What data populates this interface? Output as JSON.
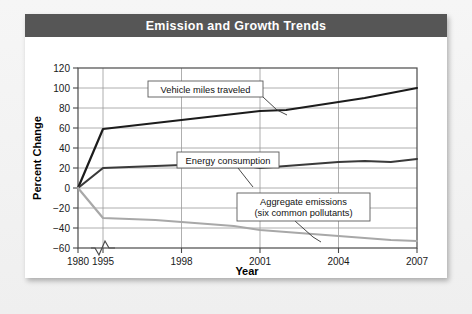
{
  "card": {
    "title": "Emission and Growth Trends"
  },
  "chart_data": {
    "type": "line",
    "title": "Emission and Growth Trends",
    "xlabel": "Year",
    "ylabel": "Percent Change",
    "xlim": [
      1980,
      2007
    ],
    "ylim": [
      -60,
      120
    ],
    "x_ticks": [
      "1980",
      "1995",
      "1998",
      "2001",
      "2004",
      "2007"
    ],
    "x_tick_values": [
      1980,
      1995,
      1998,
      2001,
      2004,
      2007
    ],
    "y_ticks": [
      "120",
      "100",
      "80",
      "60",
      "40",
      "20",
      "0",
      "−20",
      "−40",
      "−60"
    ],
    "y_tick_values": [
      120,
      100,
      80,
      60,
      40,
      20,
      0,
      -20,
      -40,
      -60
    ],
    "grid": true,
    "legend": "callout-labels",
    "axis_break": {
      "axis": "x",
      "between": [
        1980,
        1995
      ],
      "symbol": "zigzag"
    },
    "x": [
      1980,
      1995,
      1996,
      1997,
      1998,
      1999,
      2000,
      2001,
      2002,
      2003,
      2004,
      2005,
      2006,
      2007
    ],
    "series": [
      {
        "name": "Vehicle miles traveled",
        "color": "#1c1c1c",
        "values": [
          0,
          59,
          62,
          65,
          68,
          71,
          74,
          77,
          78,
          82,
          86,
          90,
          95,
          100
        ]
      },
      {
        "name": "Energy consumption",
        "color": "#3a3a3a",
        "values": [
          0,
          20,
          21,
          22,
          23,
          24,
          24,
          20,
          22,
          24,
          26,
          27,
          26,
          29
        ]
      },
      {
        "name": "Aggregate emissions (six common pollutants)",
        "color": "#a8a8a8",
        "values": [
          0,
          -30,
          -31,
          -32,
          -34,
          -36,
          -38,
          -42,
          -44,
          -46,
          -48,
          -50,
          -52,
          -53
        ]
      }
    ],
    "annotations": [
      {
        "name": "vehicle-miles-callout",
        "lines": [
          "Vehicle miles traveled"
        ],
        "points_to_series": "Vehicle miles traveled"
      },
      {
        "name": "energy-consumption-callout",
        "lines": [
          "Energy consumption"
        ],
        "points_to_series": "Energy consumption"
      },
      {
        "name": "aggregate-emissions-callout",
        "lines": [
          "Aggregate emissions",
          "(six common pollutants)"
        ],
        "points_to_series": "Aggregate emissions (six common pollutants)"
      }
    ]
  }
}
